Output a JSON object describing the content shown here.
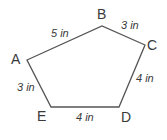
{
  "diagram": {
    "shape": "pentagon",
    "vertices": [
      {
        "label": "A",
        "x": 27,
        "y": 60
      },
      {
        "label": "B",
        "x": 102,
        "y": 26
      },
      {
        "label": "C",
        "x": 145,
        "y": 45
      },
      {
        "label": "D",
        "x": 119,
        "y": 107
      },
      {
        "label": "E",
        "x": 51,
        "y": 107
      }
    ],
    "sides": [
      {
        "from": "A",
        "to": "B",
        "length": "5 in"
      },
      {
        "from": "B",
        "to": "C",
        "length": "3 in"
      },
      {
        "from": "C",
        "to": "D",
        "length": "4 in"
      },
      {
        "from": "D",
        "to": "E",
        "length": "4 in"
      },
      {
        "from": "E",
        "to": "A",
        "length": "3 in"
      }
    ],
    "stroke_color": "#555555"
  }
}
